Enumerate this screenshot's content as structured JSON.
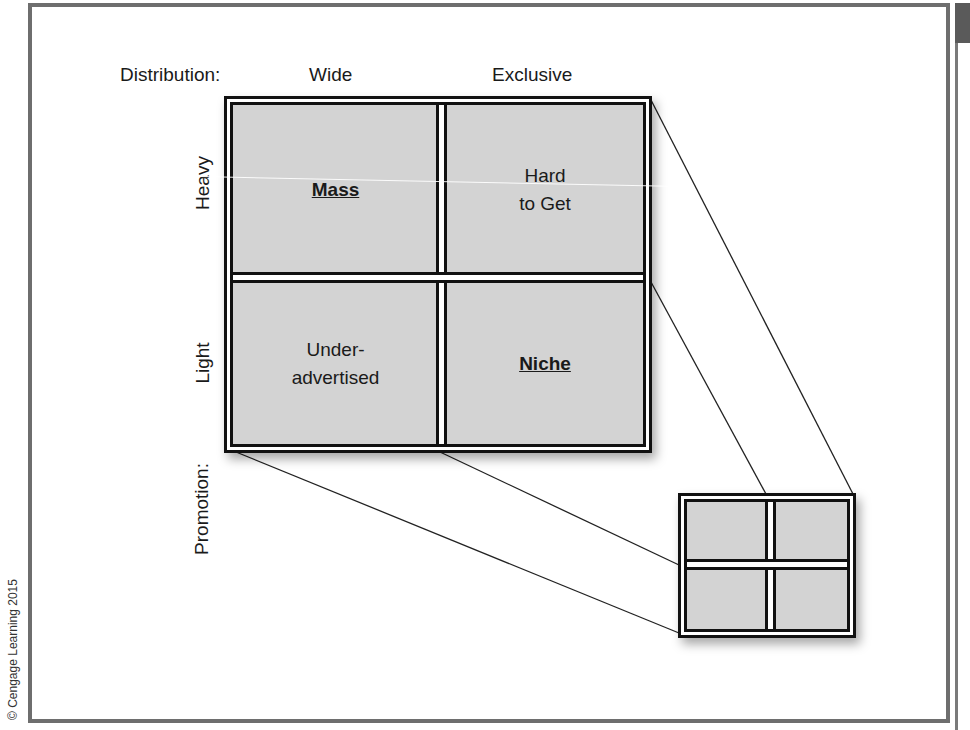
{
  "figure": {
    "distribution_label": "Distribution:",
    "distribution_levels": [
      "Wide",
      "Exclusive"
    ],
    "promotion_label": "Promotion:",
    "promotion_levels": [
      "Heavy",
      "Light"
    ],
    "cells": {
      "heavy_wide": {
        "lines": [
          "Mass"
        ],
        "emphasis": true
      },
      "heavy_exclusive": {
        "lines": [
          "Hard",
          "to Get"
        ],
        "emphasis": false
      },
      "light_wide": {
        "lines": [
          "Under-",
          "advertised"
        ],
        "emphasis": false
      },
      "light_exclusive": {
        "lines": [
          "Niche"
        ],
        "emphasis": true
      }
    },
    "copyright": "© Cengage Learning 2015",
    "colors": {
      "cell_fill": "#d3d3d3",
      "grid_line": "#111111",
      "frame": "#6e6e6e"
    }
  }
}
